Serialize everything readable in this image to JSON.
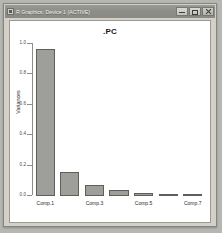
{
  "window": {
    "title": "R Graphics: Device 1 (ACTIVE)",
    "icon": "r-graphics-icon",
    "controls": {
      "minimize_label": "Minimize",
      "maximize_label": "Maximize",
      "close_label": "Close"
    },
    "frame_color": "#d4d0c8",
    "titlebar_color": "#8e8e89",
    "canvas_color": "#ffffff"
  },
  "chart_data": {
    "type": "bar",
    "title": ".PC",
    "xlabel": "",
    "ylabel": "Variances",
    "categories": [
      "Comp.1",
      "Comp.2",
      "Comp.3",
      "Comp.4",
      "Comp.5",
      "Comp.6",
      "Comp.7"
    ],
    "values": [
      0.97,
      0.155,
      0.072,
      0.038,
      0.018,
      0.01,
      0.006
    ],
    "ylim": [
      0.0,
      1.0
    ],
    "yticks": [
      0.0,
      0.2,
      0.4,
      0.6,
      0.8,
      1.0
    ],
    "ytick_labels": [
      "0.0",
      "0.2",
      "0.4",
      "0.6",
      "0.8",
      "1.0"
    ],
    "xtick_labels": [
      "Comp.1",
      "Comp.3",
      "Comp.5",
      "Comp.7"
    ],
    "xtick_categories": [
      "Comp.1",
      "Comp.3",
      "Comp.5",
      "Comp.7"
    ],
    "grid": false,
    "legend": false,
    "bar_fill": "#9e9e9b",
    "bar_border": "#5e5e5b"
  }
}
